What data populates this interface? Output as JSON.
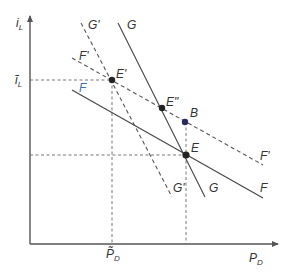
{
  "diagram": {
    "axes": {
      "y_label": "i",
      "y_label_sub": "L",
      "x_label": "P",
      "x_label_sub": "D",
      "y_tick_label": "ĩ",
      "y_tick_label_sub": "L",
      "x_tick_label": "P̃",
      "x_tick_label_sub": "D"
    },
    "curves": [
      {
        "id": "F",
        "style": "solid",
        "label_left": "F",
        "label_right": "F"
      },
      {
        "id": "F_prime",
        "style": "dashed",
        "label_left": "F'",
        "label_right": "F'"
      },
      {
        "id": "G",
        "style": "solid",
        "label_top": "G",
        "label_bottom": "G"
      },
      {
        "id": "G_prime",
        "style": "dashed",
        "label_top": "G'",
        "label_bottom": "G'"
      }
    ],
    "points": [
      {
        "id": "E_prime",
        "label": "E'"
      },
      {
        "id": "E_double_prime",
        "label": "E\""
      },
      {
        "id": "B",
        "label": "B"
      },
      {
        "id": "E",
        "label": "E"
      }
    ],
    "colors": {
      "line": "#444444",
      "label_F_left": "#3a6ea5",
      "point_B": "#2a2a5a"
    }
  }
}
